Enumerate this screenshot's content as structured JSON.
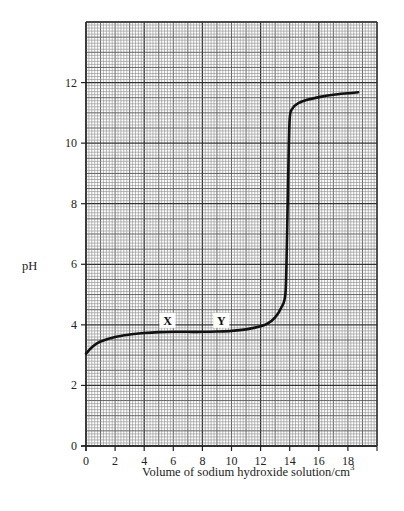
{
  "chart_data": {
    "type": "line",
    "title": "",
    "xlabel": "Volume of sodium hydroxide solution/cm",
    "xlabel_superscript": "3",
    "ylabel": "pH",
    "xlim": [
      0,
      20
    ],
    "ylim": [
      0,
      14
    ],
    "x_ticks": [
      0,
      2,
      4,
      6,
      8,
      10,
      12,
      14,
      16,
      18
    ],
    "y_ticks": [
      0,
      2,
      4,
      6,
      8,
      10,
      12
    ],
    "grid": true,
    "grid_minor_x": 0.2,
    "grid_minor_y": 0.1,
    "legend": null,
    "series": [
      {
        "name": "titration curve",
        "x": [
          0,
          0.5,
          1,
          2,
          3,
          4,
          5,
          6,
          7,
          8,
          9,
          10,
          11,
          12,
          12.5,
          13,
          13.4,
          13.7,
          13.8,
          13.9,
          14.0,
          14.2,
          14.6,
          15.2,
          16,
          17,
          18,
          18.7
        ],
        "values": [
          3.05,
          3.3,
          3.45,
          3.6,
          3.68,
          3.73,
          3.76,
          3.77,
          3.77,
          3.77,
          3.78,
          3.8,
          3.85,
          3.95,
          4.05,
          4.25,
          4.55,
          5.0,
          6.5,
          9.0,
          10.8,
          11.15,
          11.32,
          11.43,
          11.52,
          11.6,
          11.65,
          11.68
        ]
      }
    ],
    "annotations": [
      {
        "text": "X",
        "x": 5.6,
        "y": 4.1
      },
      {
        "text": "Y",
        "x": 9.3,
        "y": 4.1
      }
    ]
  },
  "labels": {
    "y_axis": "pH",
    "x_axis": "Volume of sodium hydroxide solution/cm",
    "x_axis_sup": "3",
    "point_x": "X",
    "point_y": "Y"
  }
}
